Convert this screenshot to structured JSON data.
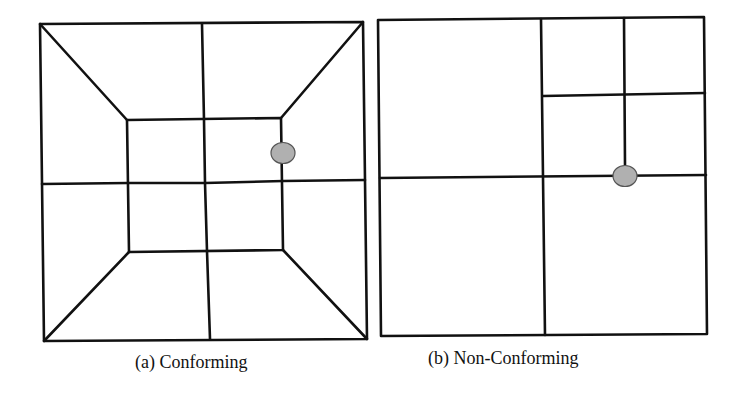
{
  "figure": {
    "panels": [
      {
        "id": "a",
        "caption": "(a) Conforming",
        "description": "Conforming quadrilateral mesh with inner square and diagonal spokes; highlighted node lies on a shared edge vertex"
      },
      {
        "id": "b",
        "caption": "(b) Non-Conforming",
        "description": "Non-conforming quadtree mesh; highlighted hanging node lies on edge of larger neighbouring cell"
      }
    ],
    "colors": {
      "line": "#111111",
      "node_fill": "#b0b0b0",
      "node_stroke": "#555555",
      "background": "#ffffff"
    }
  }
}
